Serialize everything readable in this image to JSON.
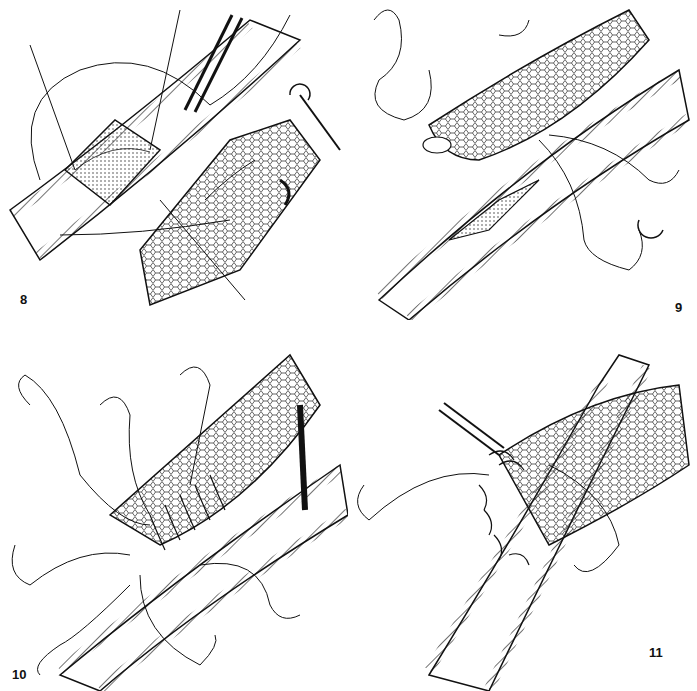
{
  "figure": {
    "panels": [
      {
        "id": "8",
        "label": "8",
        "description": "Arteriotomy opened with stay sutures; vein graft end being spatulated"
      },
      {
        "id": "9",
        "label": "9",
        "description": "Vein graft heel anchored to arteriotomy with double-armed sutures"
      },
      {
        "id": "10",
        "label": "10",
        "description": "Running suture placed along one side of the anastomosis with multiple needles"
      },
      {
        "id": "11",
        "label": "11",
        "description": "Completed end-to-side anastomosis with continuous suture"
      }
    ],
    "colors": {
      "ink": "#111111",
      "background": "#ffffff"
    }
  }
}
